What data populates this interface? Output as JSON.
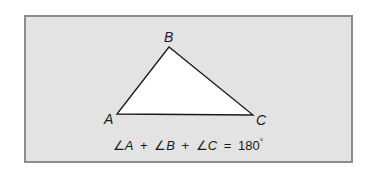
{
  "figure": {
    "background": "#e3e3e3",
    "border": "#8c8c8c",
    "triangle": {
      "fill": "#ffffff",
      "stroke": "#1a1a1a",
      "vertices": {
        "A": {
          "label": "A",
          "x": 117,
          "y": 114
        },
        "B": {
          "label": "B",
          "x": 169,
          "y": 47
        },
        "C": {
          "label": "C",
          "x": 253,
          "y": 115
        }
      }
    },
    "formula": {
      "angle_symbol": "∠",
      "terms": [
        "A",
        "B",
        "C"
      ],
      "plus": "+",
      "equals": "=",
      "value": "180",
      "degree": "°",
      "full_text": "∠A + ∠B + ∠C = 180°"
    }
  }
}
